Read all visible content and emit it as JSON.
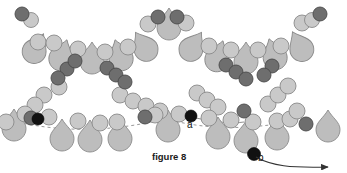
{
  "figure": {
    "caption": "figure 8",
    "title": "figure 8",
    "type": "beading-pattern-diagram",
    "background_color": "#ffffff"
  },
  "labels": {
    "point_a": "a",
    "point_b": "b"
  },
  "palette": {
    "light_bead_fill": "#c9c9c9",
    "light_bead_stroke": "#8a8a8a",
    "dark_bead_fill": "#6e6e6e",
    "dark_bead_stroke": "#4a4a4a",
    "black_bead_fill": "#111111",
    "drop_fill": "#bdbdbd",
    "drop_stroke": "#8a8a8a",
    "thread_color": "#555555",
    "arrow_color": "#333333",
    "text_color": "#1a1a1a"
  },
  "chart_data": {
    "type": "scatter",
    "title": "figure 8",
    "xlabel": "",
    "ylabel": "",
    "grid": false,
    "legend": "none",
    "xlim": [
      0,
      347
    ],
    "ylim": [
      0,
      173
    ],
    "annotations": [
      {
        "text": "a",
        "x": 187,
        "y": 124
      },
      {
        "text": "b",
        "x": 260,
        "y": 157
      },
      {
        "text": "figure 8",
        "x": 175,
        "y": 158
      }
    ],
    "series": [
      {
        "name": "light-round-beads",
        "color": "#c9c9c9",
        "shape": "circle",
        "points": [
          {
            "x": 31,
            "y": 20,
            "r": 7.5
          },
          {
            "x": 38,
            "y": 42,
            "r": 8
          },
          {
            "x": 54,
            "y": 43,
            "r": 8
          },
          {
            "x": 78,
            "y": 49,
            "r": 8
          },
          {
            "x": 105,
            "y": 52,
            "r": 8
          },
          {
            "x": 128,
            "y": 47,
            "r": 8
          },
          {
            "x": 148,
            "y": 24,
            "r": 8
          },
          {
            "x": 186,
            "y": 23,
            "r": 8
          },
          {
            "x": 209,
            "y": 46,
            "r": 8
          },
          {
            "x": 231,
            "y": 50,
            "r": 8
          },
          {
            "x": 258,
            "y": 50,
            "r": 8
          },
          {
            "x": 281,
            "y": 46,
            "r": 8
          },
          {
            "x": 302,
            "y": 23,
            "r": 8
          },
          {
            "x": 312,
            "y": 20,
            "r": 7.5
          },
          {
            "x": 44,
            "y": 95,
            "r": 8
          },
          {
            "x": 35,
            "y": 105,
            "r": 8
          },
          {
            "x": 25,
            "y": 114,
            "r": 8
          },
          {
            "x": 59,
            "y": 87,
            "r": 8
          },
          {
            "x": 120,
            "y": 95,
            "r": 8
          },
          {
            "x": 133,
            "y": 101,
            "r": 8
          },
          {
            "x": 146,
            "y": 106,
            "r": 8
          },
          {
            "x": 160,
            "y": 111,
            "r": 8
          },
          {
            "x": 197,
            "y": 93,
            "r": 8
          },
          {
            "x": 207,
            "y": 100,
            "r": 8
          },
          {
            "x": 218,
            "y": 107,
            "r": 8
          },
          {
            "x": 6,
            "y": 122,
            "r": 8
          },
          {
            "x": 49,
            "y": 117,
            "r": 8
          },
          {
            "x": 78,
            "y": 121,
            "r": 8
          },
          {
            "x": 100,
            "y": 123,
            "r": 8
          },
          {
            "x": 117,
            "y": 122,
            "r": 8
          },
          {
            "x": 155,
            "y": 115,
            "r": 8
          },
          {
            "x": 179,
            "y": 114,
            "r": 8
          },
          {
            "x": 209,
            "y": 118,
            "r": 8
          },
          {
            "x": 231,
            "y": 120,
            "r": 8
          },
          {
            "x": 253,
            "y": 122,
            "r": 8
          },
          {
            "x": 277,
            "y": 121,
            "r": 8
          },
          {
            "x": 290,
            "y": 119,
            "r": 8
          },
          {
            "x": 297,
            "y": 111,
            "r": 8
          },
          {
            "x": 268,
            "y": 104,
            "r": 8
          },
          {
            "x": 278,
            "y": 95,
            "r": 8
          },
          {
            "x": 288,
            "y": 86,
            "r": 8
          }
        ]
      },
      {
        "name": "dark-round-beads",
        "color": "#6e6e6e",
        "shape": "circle",
        "points": [
          {
            "x": 22,
            "y": 14,
            "r": 7
          },
          {
            "x": 67,
            "y": 69,
            "r": 7
          },
          {
            "x": 58,
            "y": 78,
            "r": 7
          },
          {
            "x": 75,
            "y": 61,
            "r": 7
          },
          {
            "x": 107,
            "y": 68,
            "r": 7
          },
          {
            "x": 116,
            "y": 75,
            "r": 7
          },
          {
            "x": 125,
            "y": 82,
            "r": 7
          },
          {
            "x": 158,
            "y": 17,
            "r": 7
          },
          {
            "x": 177,
            "y": 17,
            "r": 7
          },
          {
            "x": 226,
            "y": 65,
            "r": 7
          },
          {
            "x": 236,
            "y": 72,
            "r": 7
          },
          {
            "x": 246,
            "y": 79,
            "r": 7
          },
          {
            "x": 272,
            "y": 66,
            "r": 7
          },
          {
            "x": 264,
            "y": 75,
            "r": 7
          },
          {
            "x": 320,
            "y": 14,
            "r": 7
          },
          {
            "x": 145,
            "y": 117,
            "r": 7
          },
          {
            "x": 31,
            "y": 118,
            "r": 7
          },
          {
            "x": 244,
            "y": 111,
            "r": 7
          },
          {
            "x": 306,
            "y": 124,
            "r": 7
          }
        ]
      },
      {
        "name": "black-beads",
        "color": "#111111",
        "shape": "circle",
        "points": [
          {
            "x": 38,
            "y": 119,
            "r": 6
          },
          {
            "x": 191,
            "y": 116,
            "r": 6
          },
          {
            "x": 254,
            "y": 154,
            "r": 6.5
          }
        ]
      },
      {
        "name": "drop-beads",
        "color": "#bdbdbd",
        "shape": "teardrop",
        "points": [
          {
            "x": 36,
            "y": 48,
            "rot": 28
          },
          {
            "x": 62,
            "y": 55,
            "rot": 18
          },
          {
            "x": 92,
            "y": 58,
            "rot": 0
          },
          {
            "x": 120,
            "y": 55,
            "rot": -18
          },
          {
            "x": 144,
            "y": 46,
            "rot": -32
          },
          {
            "x": 169,
            "y": 24,
            "rot": 0
          },
          {
            "x": 193,
            "y": 46,
            "rot": 32
          },
          {
            "x": 218,
            "y": 56,
            "rot": 18
          },
          {
            "x": 246,
            "y": 58,
            "rot": 0
          },
          {
            "x": 274,
            "y": 54,
            "rot": -18
          },
          {
            "x": 300,
            "y": 46,
            "rot": -28
          },
          {
            "x": 14,
            "y": 125,
            "rot": 0
          },
          {
            "x": 62,
            "y": 135,
            "rot": 0
          },
          {
            "x": 90,
            "y": 136,
            "rot": 0
          },
          {
            "x": 120,
            "y": 135,
            "rot": 0
          },
          {
            "x": 168,
            "y": 126,
            "rot": 0
          },
          {
            "x": 218,
            "y": 133,
            "rot": 0
          },
          {
            "x": 246,
            "y": 137,
            "rot": 0
          },
          {
            "x": 277,
            "y": 134,
            "rot": 0
          },
          {
            "x": 328,
            "y": 126,
            "rot": 0
          }
        ]
      }
    ]
  }
}
